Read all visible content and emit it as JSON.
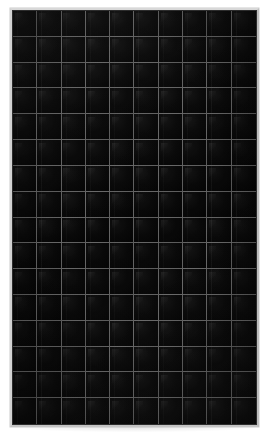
{
  "scene": {
    "subject": "solar-photovoltaic-module",
    "background_color": "#ffffff",
    "view": "front-face",
    "caption": ""
  },
  "panel": {
    "frame": {
      "name": "anodized-aluminium-frame",
      "color": "#c9c9c9",
      "highlight_color": "#d8d8d8",
      "shadow_color": "#bdbdbd",
      "thickness_px": 2
    },
    "laminate": {
      "name": "tempered-glass-laminate",
      "background_color": "#030303",
      "backsheet": "black"
    },
    "cells": {
      "type": "monocrystalline-half-cut",
      "columns": 10,
      "rows": 16,
      "total": 160,
      "cell_color": "#0a0a0a",
      "gap_color": "#b9b9b9",
      "busbars_per_cell": 3
    },
    "geometry": {
      "left_px": 10,
      "top_px": 8,
      "width_px": 249,
      "height_px": 419
    }
  }
}
